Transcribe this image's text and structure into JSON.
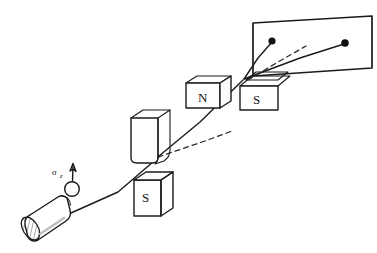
{
  "figure": {
    "style": "hand-drawn pen sketch",
    "background_color": "#ffffff",
    "ink_color": "#1b1b1b",
    "hatch_color": "#5a5a5a",
    "width": 377,
    "height": 253
  },
  "labels": {
    "spin_symbol": "σ",
    "spin_subscript": "z",
    "magnet1_top_pole": "N",
    "magnet1_bottom_pole": "S",
    "magnet2_left_pole": "N",
    "magnet2_right_pole": "S"
  },
  "components": {
    "source": {
      "name": "beam source oven",
      "shape": "cylinder",
      "end_cap": "hatched ellipse"
    },
    "spin_marker": {
      "name": "spin-up atom",
      "shape": "small circle with upward arrow",
      "arrow_direction": "up"
    },
    "magnet_stage_1": {
      "name": "first magnet pair",
      "top": "N",
      "bottom": "S",
      "top_shape": "open trough with hatched inner right face",
      "bottom_shape": "box with hatched right face"
    },
    "magnet_stage_2": {
      "name": "second magnet pair",
      "left": "N",
      "right": "S",
      "left_shape": "box with hatched top face",
      "right_shape": "box with hatched slanted top face"
    },
    "detector_screen": {
      "name": "detector screen",
      "shape": "tilted rectangle",
      "spot_count": 2
    }
  },
  "beams": {
    "incident": "solid line from source through first magnet gap",
    "undeflected": "dashed line continuing straight",
    "deflected_upper": "solid line bending upward to upper spot",
    "deflected_lower": "solid line to lower-left spot",
    "spot_labels": [
      "upper spot",
      "lower spot"
    ]
  }
}
